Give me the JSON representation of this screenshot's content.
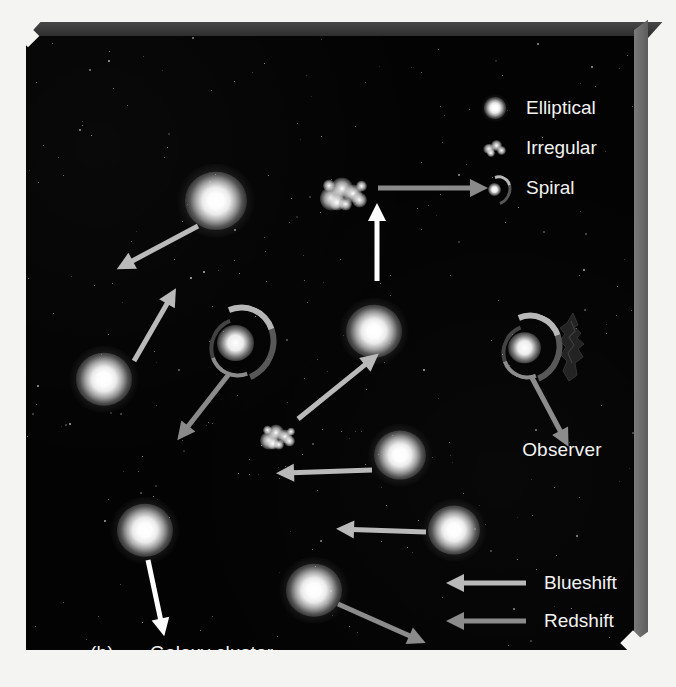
{
  "figure": {
    "panel_letter": "(b)",
    "caption": "Galaxy cluster",
    "observer_label": "Observer",
    "background_color": "#030303",
    "page_color": "#f4f4f2",
    "slab_edge_color": "#6b6b6b"
  },
  "type_legend": {
    "items": [
      {
        "label": "Elliptical",
        "icon": "elliptical-galaxy-icon"
      },
      {
        "label": "Irregular",
        "icon": "irregular-galaxy-icon"
      },
      {
        "label": "Spiral",
        "icon": "spiral-galaxy-icon"
      }
    ]
  },
  "shift_legend": {
    "items": [
      {
        "label": "Blueshift",
        "icon": "left-arrow-icon",
        "color": "#b9b9b9"
      },
      {
        "label": "Redshift",
        "icon": "left-arrow-icon",
        "color": "#8a8a8a"
      },
      {
        "label": "No shift",
        "icon": "left-arrow-icon",
        "color": "#ffffff"
      }
    ]
  },
  "galaxies": [
    {
      "name": "elliptical-upper-left",
      "type": "elliptical",
      "x": 190,
      "y": 165,
      "size": 62
    },
    {
      "name": "elliptical-left-edge",
      "type": "elliptical",
      "x": 78,
      "y": 343,
      "size": 56
    },
    {
      "name": "irregular-top",
      "type": "irregular",
      "x": 318,
      "y": 158,
      "size": 54
    },
    {
      "name": "spiral-upper-left",
      "type": "spiral",
      "x": 212,
      "y": 305,
      "size": 80
    },
    {
      "name": "elliptical-center",
      "type": "elliptical",
      "x": 348,
      "y": 295,
      "size": 56
    },
    {
      "name": "irregular-center",
      "type": "irregular",
      "x": 252,
      "y": 401,
      "size": 40
    },
    {
      "name": "elliptical-center-right",
      "type": "elliptical",
      "x": 374,
      "y": 419,
      "size": 52
    },
    {
      "name": "spiral-right",
      "type": "spiral",
      "x": 501,
      "y": 310,
      "size": 72
    },
    {
      "name": "elliptical-lower-left",
      "type": "elliptical",
      "x": 119,
      "y": 494,
      "size": 56
    },
    {
      "name": "elliptical-lower-right",
      "type": "elliptical",
      "x": 428,
      "y": 494,
      "size": 52
    },
    {
      "name": "elliptical-bottom",
      "type": "elliptical",
      "x": 288,
      "y": 554,
      "size": 56
    }
  ],
  "arrows": [
    {
      "name": "arrow-upper-left-blueshift",
      "shift": "blue",
      "x": 172,
      "y": 190,
      "length": 92,
      "angle": 152
    },
    {
      "name": "arrow-left-edge-blueshift",
      "shift": "blue",
      "x": 108,
      "y": 325,
      "length": 84,
      "angle": 300
    },
    {
      "name": "arrow-irregular-top-red",
      "shift": "red",
      "x": 352,
      "y": 152,
      "length": 110,
      "angle": 0
    },
    {
      "name": "arrow-irregular-top-none",
      "shift": "none",
      "x": 351,
      "y": 245,
      "length": 78,
      "angle": 270
    },
    {
      "name": "arrow-spiral-upper-red",
      "shift": "red",
      "x": 203,
      "y": 338,
      "length": 84,
      "angle": 128
    },
    {
      "name": "arrow-center-blueshift",
      "shift": "blue",
      "x": 272,
      "y": 383,
      "length": 104,
      "angle": 321
    },
    {
      "name": "arrow-center-right-blue",
      "shift": "blue",
      "x": 346,
      "y": 434,
      "length": 96,
      "angle": 178
    },
    {
      "name": "arrow-spiral-right-red",
      "shift": "red",
      "x": 505,
      "y": 340,
      "length": 80,
      "angle": 62
    },
    {
      "name": "arrow-lower-left-none",
      "shift": "none",
      "x": 122,
      "y": 524,
      "length": 78,
      "angle": 78
    },
    {
      "name": "arrow-lower-right-blue",
      "shift": "blue",
      "x": 400,
      "y": 496,
      "length": 90,
      "angle": 182
    },
    {
      "name": "arrow-bottom-red",
      "shift": "red",
      "x": 312,
      "y": 568,
      "length": 96,
      "angle": 24
    }
  ]
}
